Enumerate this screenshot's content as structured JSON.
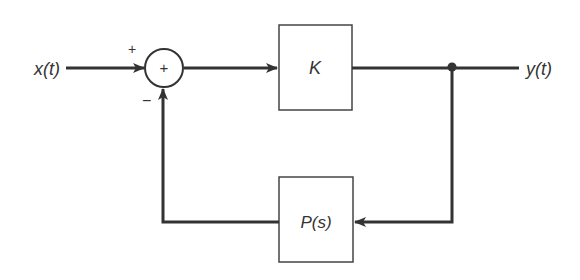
{
  "diagram": {
    "type": "feedback-control-block-diagram",
    "colors": {
      "line": "#333333",
      "box_border": "#444444",
      "background": "#ffffff"
    },
    "input": {
      "label": "x(t)"
    },
    "output": {
      "label": "y(t)"
    },
    "summing_junction": {
      "symbol": "+",
      "input_sign_plus": "+",
      "feedback_sign_minus": "−"
    },
    "forward_block": {
      "label": "K"
    },
    "feedback_block": {
      "label": "P(s)"
    }
  }
}
